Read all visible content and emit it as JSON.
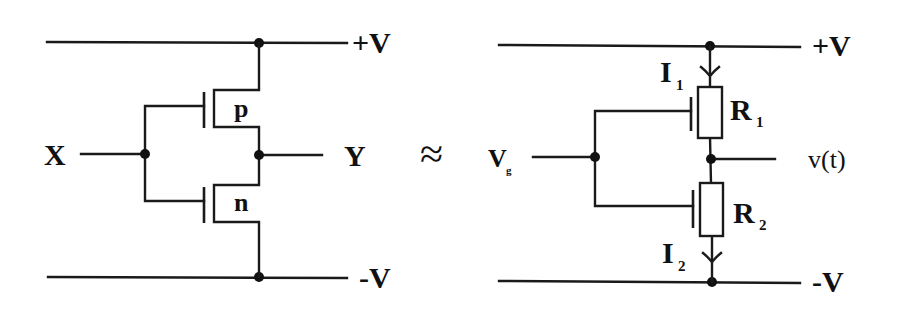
{
  "diagram": {
    "type": "circuit-equivalence",
    "relation_symbol": "≈",
    "left_circuit": {
      "name": "CMOS inverter",
      "rail_top": "+V",
      "rail_bottom": "-V",
      "input": "X",
      "output": "Y",
      "transistor_top": "p",
      "transistor_bottom": "n"
    },
    "right_circuit": {
      "name": "Variable resistor model",
      "rail_top": "+V",
      "rail_bottom": "-V",
      "input_main": "V",
      "input_sub": "g",
      "output": "v(t)",
      "resistor_top": {
        "main": "R",
        "sub": "1"
      },
      "resistor_bottom": {
        "main": "R",
        "sub": "2"
      },
      "current_top": {
        "main": "I",
        "sub": "1"
      },
      "current_bottom": {
        "main": "I",
        "sub": "2"
      }
    },
    "colors": {
      "ink": "#111111",
      "background": "#ffffff"
    }
  }
}
